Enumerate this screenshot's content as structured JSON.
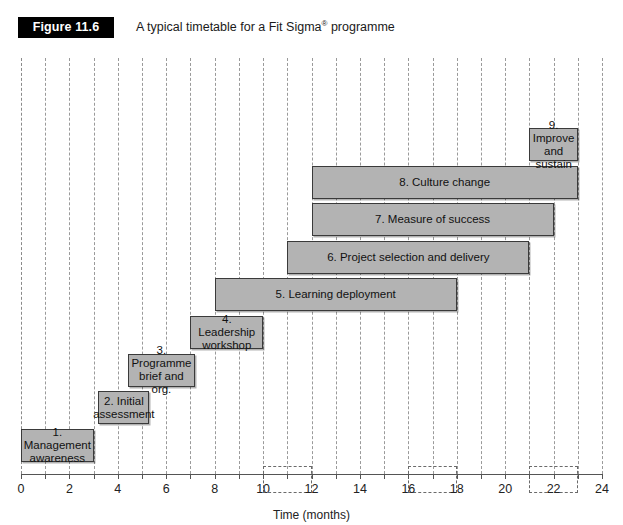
{
  "figure": {
    "badge": "Figure 11.6",
    "caption_before": "A typical timetable for a Fit Sigma",
    "caption_sup": "®",
    "caption_after": " programme"
  },
  "axis": {
    "title": "Time (months)",
    "min": 0,
    "max": 24,
    "tick_step": 1,
    "labelled_ticks": [
      0,
      2,
      4,
      6,
      8,
      10,
      12,
      14,
      16,
      18,
      20,
      22,
      24
    ],
    "tick_labels": [
      "0",
      "2",
      "4",
      "6",
      "8",
      "10",
      "12",
      "14",
      "16",
      "18",
      "20",
      "22",
      "24"
    ]
  },
  "colors": {
    "bar_fill": "#b3b3b3",
    "bar_border": "#3a3a3a",
    "gridline": "#9a9a9a",
    "badge_bg": "#000000",
    "badge_text": "#ffffff",
    "review_border": "#6a6a6a"
  },
  "chart_data": {
    "type": "bar",
    "orientation": "horizontal",
    "subtype": "gantt",
    "title": "A typical timetable for a Fit Sigma® programme",
    "xlabel": "Time (months)",
    "ylabel": "",
    "xlim": [
      0,
      24
    ],
    "grid": true,
    "legend": "none",
    "categories": [
      "1. Management awareness",
      "2. Initial assessment",
      "3. Programme brief and org.",
      "4. Leadership workshop",
      "5. Learning deployment",
      "6. Project selection and delivery",
      "7. Measure of success",
      "8. Culture change",
      "9. Improve and sustain"
    ],
    "tasks": [
      {
        "label": "1. Management\nawareness",
        "start": 0,
        "end": 3,
        "row": 8
      },
      {
        "label": "2. Initial\nassessment",
        "start": 3.2,
        "end": 5.3,
        "row": 7
      },
      {
        "label": "3. Programme\nbrief and org.",
        "start": 4.4,
        "end": 7.2,
        "row": 6
      },
      {
        "label": "4. Leadership\nworkshop",
        "start": 7.0,
        "end": 10.0,
        "row": 5
      },
      {
        "label": "5. Learning deployment",
        "start": 8.0,
        "end": 18.0,
        "row": 4
      },
      {
        "label": "6. Project selection and delivery",
        "start": 11.0,
        "end": 21.0,
        "row": 3
      },
      {
        "label": "7. Measure of success",
        "start": 12.0,
        "end": 22.0,
        "row": 2
      },
      {
        "label": "8. Culture change",
        "start": 12.0,
        "end": 23.0,
        "row": 1
      },
      {
        "label": "9. Improve\nand sustain",
        "start": 21.0,
        "end": 23.0,
        "row": 0
      }
    ],
    "review_boxes": [
      {
        "start": 10.0,
        "end": 12.0,
        "row": 9
      },
      {
        "start": 16.0,
        "end": 18.0,
        "row": 9
      },
      {
        "start": 21.0,
        "end": 23.0,
        "row": 9
      }
    ]
  }
}
